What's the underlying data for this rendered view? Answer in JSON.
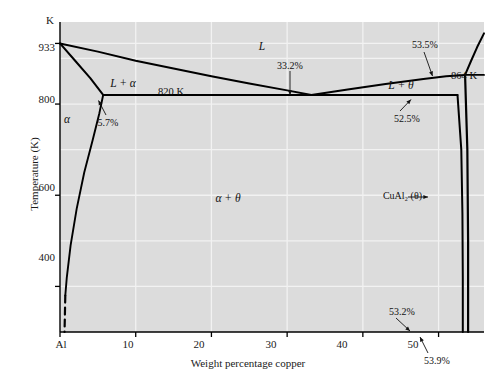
{
  "figure": {
    "background_color": "#ffffff",
    "plot_background_color": "#dcdcdc",
    "gridline_color": "#f2f2f2",
    "curve_color": "#000000",
    "axis_color": "#000000"
  },
  "axes": {
    "y_unit_label": "K",
    "y_axis_title": "Temperature (K)",
    "x_axis_title": "Weight percentage copper",
    "y_ticks": [
      {
        "label": "933",
        "value": 933
      },
      {
        "label": "800",
        "value": 800
      },
      {
        "label": "600",
        "value": 600
      },
      {
        "label": "400",
        "value": 400
      }
    ],
    "x_ticks": [
      {
        "label": "Al",
        "value": 0
      },
      {
        "label": "10",
        "value": 10
      },
      {
        "label": "20",
        "value": 20
      },
      {
        "label": "30",
        "value": 30
      },
      {
        "label": "40",
        "value": 40
      },
      {
        "label": "50",
        "value": 50
      }
    ],
    "xlim": [
      0,
      56
    ],
    "ylim": [
      300,
      980
    ]
  },
  "regions": [
    {
      "name": "liquid",
      "label": "L",
      "x": 56.0,
      "y": 300
    },
    {
      "name": "liquid-plus-alpha",
      "label": "L + α",
      "x": 7.4,
      "y": 853
    },
    {
      "name": "alpha",
      "label": "α",
      "x": 0.9,
      "y": 763
    },
    {
      "name": "alpha-plus-theta",
      "label": "α + θ",
      "x": 24.0,
      "y": 600
    },
    {
      "name": "liquid-plus-theta",
      "label": "L + θ",
      "x": 45.6,
      "y": 843
    }
  ],
  "annotations": [
    {
      "name": "eutectic-temperature",
      "label": "820 K"
    },
    {
      "name": "peritectic-temperature",
      "label": "864 K"
    },
    {
      "name": "alpha-solubility-limit",
      "label": "5.7%"
    },
    {
      "name": "eutectic-composition",
      "label": "33.2%"
    },
    {
      "name": "theta-liquidus-composition",
      "label": "53.5%"
    },
    {
      "name": "theta-eutectic-composition",
      "label": "52.5%"
    },
    {
      "name": "theta-lower-boundary",
      "label": "53.2%"
    },
    {
      "name": "theta-upper-boundary",
      "label": "53.9%"
    },
    {
      "name": "theta-phase-compound",
      "label": "CuAl₂ (θ)"
    }
  ],
  "chart_data": {
    "type": "line",
    "title": "",
    "xlabel": "Weight percentage copper",
    "ylabel": "Temperature (K)",
    "xlim": [
      0,
      56
    ],
    "ylim": [
      300,
      980
    ],
    "grid": true,
    "legend": "none",
    "key_points": {
      "al_melting_point": {
        "composition": 0,
        "temperature": 933
      },
      "eutectic": {
        "composition": 33.2,
        "temperature": 820
      },
      "alpha_max_solubility": {
        "composition": 5.7,
        "temperature": 820
      },
      "theta_at_eutectic": {
        "composition": 52.5,
        "temperature": 820
      },
      "peritectic": {
        "composition": 53.5,
        "temperature": 864
      },
      "theta_lower_bound": {
        "composition": 53.2,
        "temperature": 300
      },
      "theta_upper_bound": {
        "composition": 53.9,
        "temperature": 300
      }
    },
    "series": [
      {
        "name": "liquidus-al-side",
        "points": [
          [
            0,
            933
          ],
          [
            5,
            915
          ],
          [
            10,
            895
          ],
          [
            15,
            878
          ],
          [
            20,
            861
          ],
          [
            25,
            845
          ],
          [
            30,
            830
          ],
          [
            33.2,
            820
          ]
        ]
      },
      {
        "name": "liquidus-theta-side",
        "points": [
          [
            33.2,
            820
          ],
          [
            38,
            832
          ],
          [
            43,
            844
          ],
          [
            48,
            855
          ],
          [
            51,
            861
          ],
          [
            53.5,
            864
          ]
        ]
      },
      {
        "name": "solidus-alpha",
        "points": [
          [
            0,
            933
          ],
          [
            2,
            895
          ],
          [
            4,
            857
          ],
          [
            5.7,
            820
          ]
        ]
      },
      {
        "name": "solvus-alpha",
        "points": [
          [
            5.7,
            820
          ],
          [
            5.2,
            780
          ],
          [
            4.3,
            720
          ],
          [
            3.2,
            650
          ],
          [
            2.2,
            570
          ],
          [
            1.4,
            490
          ],
          [
            0.9,
            420
          ],
          [
            0.7,
            380
          ]
        ]
      },
      {
        "name": "eutectic-isotherm",
        "points": [
          [
            5.7,
            820
          ],
          [
            52.5,
            820
          ]
        ]
      },
      {
        "name": "peritectic-isotherm",
        "points": [
          [
            53.5,
            864
          ],
          [
            56,
            864
          ]
        ]
      },
      {
        "name": "theta-left-boundary",
        "points": [
          [
            52.5,
            820
          ],
          [
            53.0,
            700
          ],
          [
            53.15,
            560
          ],
          [
            53.2,
            420
          ],
          [
            53.2,
            300
          ]
        ]
      },
      {
        "name": "theta-right-boundary",
        "points": [
          [
            53.5,
            864
          ],
          [
            53.8,
            700
          ],
          [
            53.9,
            500
          ],
          [
            53.9,
            300
          ]
        ]
      },
      {
        "name": "theta-liquidus-right",
        "points": [
          [
            53.5,
            864
          ],
          [
            54.3,
            895
          ],
          [
            55.1,
            925
          ],
          [
            56,
            955
          ]
        ]
      },
      {
        "name": "alpha-solvus-dashed",
        "points": [
          [
            0.7,
            380
          ],
          [
            0.6,
            300
          ]
        ]
      }
    ]
  }
}
